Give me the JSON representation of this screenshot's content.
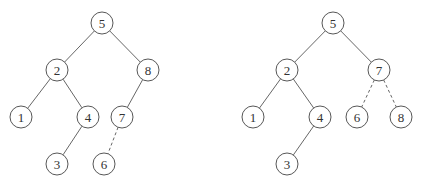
{
  "diagram": {
    "radius": 11,
    "trees": [
      {
        "name": "before-rotation",
        "nodes": [
          {
            "id": "5",
            "label": "5",
            "x": 102,
            "y": 23
          },
          {
            "id": "2",
            "label": "2",
            "x": 57,
            "y": 70
          },
          {
            "id": "8",
            "label": "8",
            "x": 148,
            "y": 70
          },
          {
            "id": "1",
            "label": "1",
            "x": 21,
            "y": 117
          },
          {
            "id": "4",
            "label": "4",
            "x": 88,
            "y": 117
          },
          {
            "id": "7",
            "label": "7",
            "x": 122,
            "y": 117
          },
          {
            "id": "3",
            "label": "3",
            "x": 57,
            "y": 164
          },
          {
            "id": "6",
            "label": "6",
            "x": 104,
            "y": 164
          }
        ],
        "edges": [
          {
            "from": "5",
            "to": "2",
            "style": "solid"
          },
          {
            "from": "5",
            "to": "8",
            "style": "solid"
          },
          {
            "from": "2",
            "to": "1",
            "style": "solid"
          },
          {
            "from": "2",
            "to": "4",
            "style": "solid"
          },
          {
            "from": "8",
            "to": "7",
            "style": "solid"
          },
          {
            "from": "4",
            "to": "3",
            "style": "solid"
          },
          {
            "from": "7",
            "to": "6",
            "style": "dashed"
          }
        ]
      },
      {
        "name": "after-rotation",
        "nodes": [
          {
            "id": "5",
            "label": "5",
            "x": 333,
            "y": 23
          },
          {
            "id": "2",
            "label": "2",
            "x": 287,
            "y": 70
          },
          {
            "id": "7",
            "label": "7",
            "x": 379,
            "y": 70
          },
          {
            "id": "1",
            "label": "1",
            "x": 253,
            "y": 117
          },
          {
            "id": "4",
            "label": "4",
            "x": 320,
            "y": 117
          },
          {
            "id": "6",
            "label": "6",
            "x": 357,
            "y": 117
          },
          {
            "id": "8",
            "label": "8",
            "x": 401,
            "y": 117
          },
          {
            "id": "3",
            "label": "3",
            "x": 287,
            "y": 164
          }
        ],
        "edges": [
          {
            "from": "5",
            "to": "2",
            "style": "solid"
          },
          {
            "from": "5",
            "to": "7",
            "style": "solid"
          },
          {
            "from": "2",
            "to": "1",
            "style": "solid"
          },
          {
            "from": "2",
            "to": "4",
            "style": "solid"
          },
          {
            "from": "4",
            "to": "3",
            "style": "solid"
          },
          {
            "from": "7",
            "to": "6",
            "style": "dashed"
          },
          {
            "from": "7",
            "to": "8",
            "style": "dashed"
          }
        ]
      }
    ]
  }
}
